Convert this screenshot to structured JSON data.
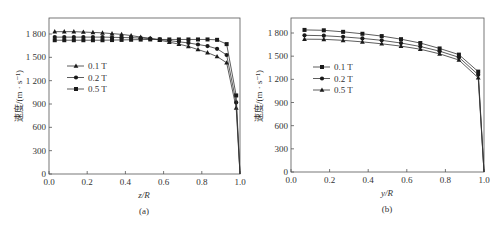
{
  "figure": {
    "panels": [
      {
        "id": "a",
        "caption": "(a)",
        "xlabel": "z/R",
        "ylabel": "速度/(m · s⁻¹)",
        "xticks": [
          "0.0",
          "0.2",
          "0.4",
          "0.6",
          "0.8",
          "1.0"
        ],
        "yticks": [
          "0",
          "300",
          "600",
          "900",
          "1 200",
          "1 500",
          "1 800"
        ],
        "legend": [
          {
            "label": "0.1 T",
            "marker": "triangle"
          },
          {
            "label": "0.2 T",
            "marker": "circle"
          },
          {
            "label": "0.5 T",
            "marker": "square"
          }
        ]
      },
      {
        "id": "b",
        "caption": "(b)",
        "xlabel": "y/R",
        "ylabel": "速度/(m · s⁻¹)",
        "xticks": [
          "0.0",
          "0.2",
          "0.4",
          "0.6",
          "0.8",
          "1.0"
        ],
        "yticks": [
          "0",
          "300",
          "600",
          "900",
          "1 200",
          "1 500",
          "1 800"
        ],
        "legend": [
          {
            "label": "0.1 T",
            "marker": "square"
          },
          {
            "label": "0.2 T",
            "marker": "circle"
          },
          {
            "label": "0.5 T",
            "marker": "triangle"
          }
        ]
      }
    ]
  },
  "chart_data": [
    {
      "type": "line",
      "panel": "(a)",
      "title": "",
      "xlabel": "z/R",
      "ylabel": "速度/(m · s⁻¹)",
      "xlim": [
        0.0,
        1.0
      ],
      "ylim": [
        0,
        2050
      ],
      "grid": false,
      "legend_position": "left-middle",
      "x": [
        0.03,
        0.08,
        0.13,
        0.18,
        0.23,
        0.28,
        0.33,
        0.38,
        0.43,
        0.48,
        0.53,
        0.58,
        0.63,
        0.68,
        0.73,
        0.78,
        0.83,
        0.88,
        0.93,
        0.98,
        1.0
      ],
      "series": [
        {
          "name": "0.1 T",
          "marker": "triangle",
          "values": [
            1830,
            1830,
            1830,
            1825,
            1820,
            1815,
            1805,
            1795,
            1780,
            1760,
            1745,
            1720,
            1695,
            1670,
            1640,
            1600,
            1560,
            1510,
            1430,
            850,
            0
          ]
        },
        {
          "name": "0.2 T",
          "marker": "circle",
          "values": [
            1760,
            1760,
            1760,
            1760,
            1760,
            1760,
            1758,
            1755,
            1752,
            1748,
            1740,
            1730,
            1715,
            1700,
            1685,
            1665,
            1645,
            1610,
            1530,
            920,
            0
          ]
        },
        {
          "name": "0.5 T",
          "marker": "square",
          "values": [
            1720,
            1720,
            1720,
            1720,
            1720,
            1720,
            1722,
            1724,
            1726,
            1728,
            1730,
            1730,
            1730,
            1730,
            1730,
            1730,
            1730,
            1725,
            1670,
            1010,
            0
          ]
        }
      ]
    },
    {
      "type": "line",
      "panel": "(b)",
      "title": "",
      "xlabel": "y/R",
      "ylabel": "速度/(m · s⁻¹)",
      "xlim": [
        0.0,
        1.0
      ],
      "ylim": [
        0,
        2050
      ],
      "grid": false,
      "legend_position": "left-middle",
      "x": [
        0.07,
        0.17,
        0.27,
        0.37,
        0.47,
        0.57,
        0.67,
        0.77,
        0.87,
        0.97,
        1.0
      ],
      "series": [
        {
          "name": "0.1 T",
          "marker": "square",
          "values": [
            1840,
            1835,
            1815,
            1790,
            1760,
            1720,
            1670,
            1600,
            1520,
            1300,
            0
          ]
        },
        {
          "name": "0.2 T",
          "marker": "circle",
          "values": [
            1770,
            1765,
            1750,
            1730,
            1705,
            1670,
            1625,
            1565,
            1485,
            1260,
            0
          ]
        },
        {
          "name": "0.5 T",
          "marker": "triangle",
          "values": [
            1720,
            1718,
            1705,
            1685,
            1660,
            1630,
            1590,
            1530,
            1450,
            1220,
            0
          ]
        }
      ]
    }
  ]
}
